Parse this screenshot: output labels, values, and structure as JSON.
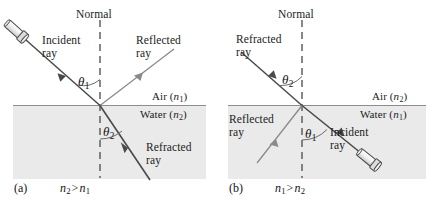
{
  "figure": {
    "type": "physics-optics-diagram",
    "background_color": "#ffffff",
    "ink_color": "#1b1b1b",
    "water_fill_color": "#eaeaea",
    "ray_color": "#4a4a4a",
    "normal_line_color": "#555555"
  },
  "panels": [
    {
      "id": "a",
      "caption_letter": "(a)",
      "caption_relation": {
        "left": "n",
        "left_sub": "2",
        "operator": ">",
        "right": "n",
        "right_sub": "1"
      },
      "normal_label": "Normal",
      "media": {
        "upper_label": "Air",
        "upper_index": "n",
        "upper_index_sub": "1",
        "lower_label": "Water",
        "lower_index": "n",
        "lower_index_sub": "2"
      },
      "rays": [
        {
          "name": "incident-ray",
          "label": "Incident\nray",
          "has_source_icon": true
        },
        {
          "name": "reflected-ray",
          "label": "Reflected\nray",
          "has_source_icon": false
        },
        {
          "name": "refracted-ray",
          "label": "Refracted\nray",
          "has_source_icon": false
        }
      ],
      "angles": [
        {
          "name": "theta-1",
          "symbol": "θ",
          "sub": "1",
          "region": "air"
        },
        {
          "name": "theta-2",
          "symbol": "θ",
          "sub": "2",
          "region": "water"
        }
      ]
    },
    {
      "id": "b",
      "caption_letter": "(b)",
      "caption_relation": {
        "left": "n",
        "left_sub": "1",
        "operator": ">",
        "right": "n",
        "right_sub": "2"
      },
      "normal_label": "Normal",
      "media": {
        "upper_label": "Air",
        "upper_index": "n",
        "upper_index_sub": "2",
        "lower_label": "Water",
        "lower_index": "n",
        "lower_index_sub": "1"
      },
      "rays": [
        {
          "name": "incident-ray",
          "label": "Incident\nray",
          "has_source_icon": true
        },
        {
          "name": "reflected-ray",
          "label": "Reflected\nray",
          "has_source_icon": false
        },
        {
          "name": "refracted-ray",
          "label": "Refracted\nray",
          "has_source_icon": false
        }
      ],
      "angles": [
        {
          "name": "theta-2",
          "symbol": "θ",
          "sub": "2",
          "region": "air"
        },
        {
          "name": "theta-1",
          "symbol": "θ",
          "sub": "1",
          "region": "water"
        }
      ]
    }
  ]
}
